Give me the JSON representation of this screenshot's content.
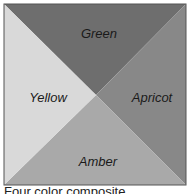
{
  "diagram": {
    "title": "Four color composite",
    "quadrants": [
      {
        "name": "Green",
        "position": "top",
        "color": "#6e6e6e"
      },
      {
        "name": "Apricot",
        "position": "right",
        "color": "#888888"
      },
      {
        "name": "Amber",
        "position": "bottom",
        "color": "#a9a9a9"
      },
      {
        "name": "Yellow",
        "position": "left",
        "color": "#d9d9d9"
      }
    ]
  }
}
